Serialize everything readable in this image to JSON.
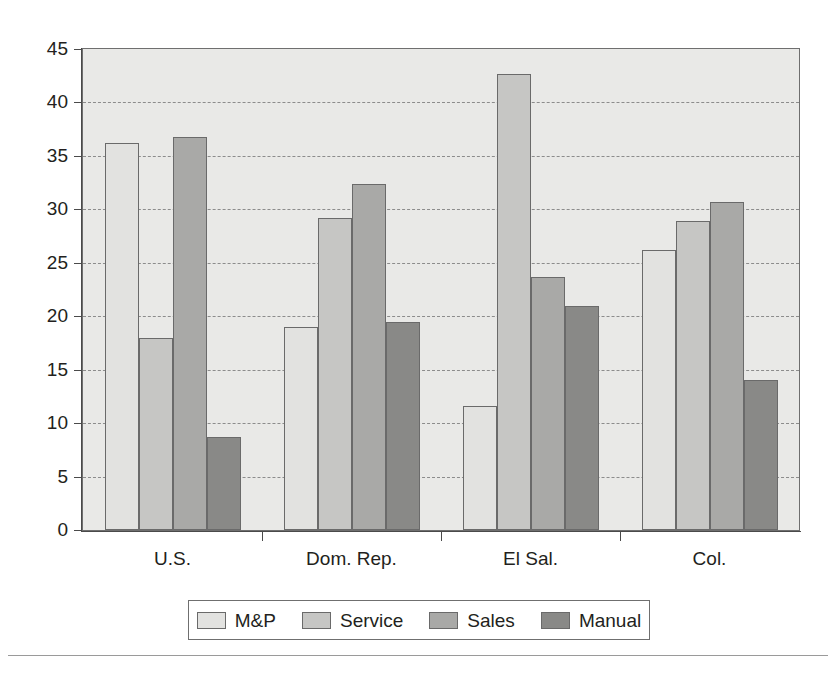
{
  "chart_data": {
    "type": "bar",
    "title": "",
    "subtitle": "",
    "xlabel": "",
    "ylabel": "",
    "ylim": [
      0,
      45
    ],
    "yticks": [
      0,
      5,
      10,
      15,
      20,
      25,
      30,
      35,
      40,
      45
    ],
    "grid": true,
    "grid_axis": "y",
    "legend_position": "bottom",
    "categories": [
      "U.S.",
      "Dom. Rep.",
      "El Sal.",
      "Col."
    ],
    "series": [
      {
        "name": "M&P",
        "color": "#e2e2e0",
        "values": [
          36.2,
          19.0,
          11.6,
          26.2
        ]
      },
      {
        "name": "Service",
        "color": "#c6c6c4",
        "values": [
          18.0,
          29.2,
          42.7,
          28.9
        ]
      },
      {
        "name": "Sales",
        "color": "#a9a9a7",
        "values": [
          36.8,
          32.4,
          23.7,
          30.7
        ]
      },
      {
        "name": "Manual",
        "color": "#898987",
        "values": [
          8.7,
          19.5,
          21.0,
          14.0
        ]
      }
    ]
  },
  "legend": {
    "entries": [
      {
        "label": "M&P"
      },
      {
        "label": "Service"
      },
      {
        "label": "Sales"
      },
      {
        "label": "Manual"
      }
    ]
  },
  "axes": {
    "y_tick_labels": [
      "45",
      "40",
      "35",
      "30",
      "25",
      "20",
      "15",
      "10",
      "5",
      "0"
    ],
    "x_tick_labels": [
      "U.S.",
      "Dom. Rep.",
      "El Sal.",
      "Col."
    ]
  }
}
